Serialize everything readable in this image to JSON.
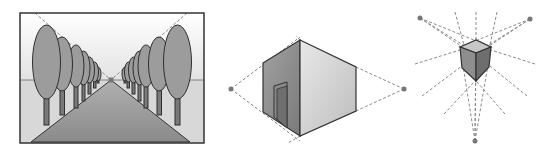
{
  "figure": {
    "colors": {
      "background": "#ffffff",
      "outline": "#3a3a3a",
      "sky_top": "#ffffff",
      "sky_bottom": "#e4e4e4",
      "ground": "#d6d6d6",
      "road": "#8e8e8e",
      "tree_foliage": "#9c9c9c",
      "tree_trunk": "#7a7a7a",
      "guide_line": "#8a8a8a",
      "vanishing_point": "#777777",
      "box_left_face": "#8f8f8f",
      "box_right_face": "#dcdcdc",
      "cube_top": "#c8c8c8",
      "cube_left": "#8a8a8a",
      "cube_right": "#6e6e6e"
    },
    "panels": [
      {
        "name": "one-point-perspective",
        "subject": "tree-lined road",
        "vanishing_points": 1,
        "frame": {
          "x": 20,
          "y": 13,
          "w": 184,
          "h": 130
        },
        "horizon_y": 80,
        "vanishing_point": [
          111,
          80
        ]
      },
      {
        "name": "two-point-perspective",
        "subject": "box building with door",
        "vanishing_points": 2,
        "vp_left": [
          231,
          89
        ],
        "vp_right": [
          404,
          90
        ]
      },
      {
        "name": "three-point-perspective",
        "subject": "cube",
        "vanishing_points": 3,
        "vp_top_left": [
          420,
          18
        ],
        "vp_top_right": [
          530,
          19
        ],
        "vp_bottom": [
          475,
          141
        ]
      }
    ]
  }
}
